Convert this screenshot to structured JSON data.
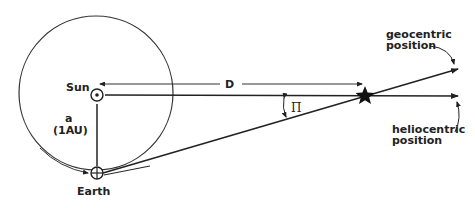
{
  "diagram": {
    "labels": {
      "sun": "Sun",
      "earth": "Earth",
      "semi_major_axis": "a",
      "semi_major_axis_unit": "(1AU)",
      "distance": "D",
      "parallax_angle": "Π",
      "geocentric_line1": "geocentric",
      "geocentric_line2": "position",
      "heliocentric_line1": "heliocentric",
      "heliocentric_line2": "position"
    },
    "colors": {
      "stroke": "#222222",
      "background": "#ffffff"
    }
  }
}
